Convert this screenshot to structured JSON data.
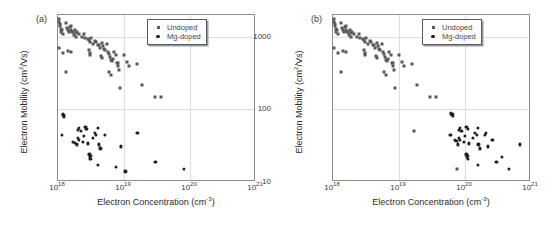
{
  "figure": {
    "panels": [
      {
        "letter": "(a)",
        "xlabel": "Electron Concentration (cm",
        "xlabel_sup": "-3",
        "xlabel_tail": ")",
        "ylabel_head": "Electron Mobility (cm",
        "ylabel_sup": "2",
        "ylabel_tail": "/Vs)",
        "legend": [
          {
            "label": "Undoped",
            "marker": "square"
          },
          {
            "label": "Mg-doped",
            "marker": "circle"
          }
        ]
      },
      {
        "letter": "(b)",
        "xlabel": "Electron Concentration (cm",
        "xlabel_sup": "-3",
        "xlabel_tail": ")",
        "ylabel_head": "Electron Mobility (cm",
        "ylabel_sup": "2",
        "ylabel_tail": "/Vs)",
        "legend": [
          {
            "label": "Undoped",
            "marker": "square"
          },
          {
            "label": "Mg-doped",
            "marker": "circle"
          }
        ]
      }
    ]
  },
  "chart_data": [
    {
      "type": "scatter",
      "panel": "(a)",
      "title": "",
      "xlabel": "Electron Concentration (cm^-3)",
      "ylabel": "Electron Mobility (cm^2/Vs)",
      "xscale": "log",
      "yscale": "log",
      "xlim": [
        1e+18,
        1e+21
      ],
      "ylim": [
        10,
        2000
      ],
      "xticks": [
        1e+18,
        1e+19,
        1e+20,
        1e+21
      ],
      "xticklabels": [
        "10^18",
        "10^19",
        "10^20",
        "10^21"
      ],
      "yticks": [
        10,
        100,
        1000
      ],
      "yticklabels": [
        "10",
        "100",
        "1000"
      ],
      "grid": true,
      "legend_position": "upper right",
      "series": [
        {
          "name": "Undoped",
          "marker": "square",
          "color": "#55595e",
          "points": [
            [
              1.02e+18,
              1750
            ],
            [
              1.05e+18,
              1620
            ],
            [
              1.06e+18,
              1500
            ],
            [
              1.08e+18,
              1400
            ],
            [
              1.1e+18,
              1300
            ],
            [
              1.12e+18,
              1180
            ],
            [
              1.15e+18,
              1250
            ],
            [
              1.18e+18,
              1100
            ],
            [
              1.05e+18,
              700
            ],
            [
              1.2e+18,
              590
            ],
            [
              1.3e+18,
              1550
            ],
            [
              1.35e+18,
              1320
            ],
            [
              1.4e+18,
              1240
            ],
            [
              1.45e+18,
              1150
            ],
            [
              1.5e+18,
              1380
            ],
            [
              1.55e+18,
              1260
            ],
            [
              1.6e+18,
              1420
            ],
            [
              1.65e+18,
              1180
            ],
            [
              1.7e+18,
              1150
            ],
            [
              1.75e+18,
              1050
            ],
            [
              1.8e+18,
              1230
            ],
            [
              1.85e+18,
              1130
            ],
            [
              1.9e+18,
              980
            ],
            [
              1.95e+18,
              1160
            ],
            [
              1.4e+18,
              640
            ],
            [
              1.55e+18,
              610
            ],
            [
              1.3e+18,
              330
            ],
            [
              2.1e+18,
              1080
            ],
            [
              2.3e+18,
              1010
            ],
            [
              2.5e+18,
              1090
            ],
            [
              2.6e+18,
              960
            ],
            [
              2.8e+18,
              930
            ],
            [
              3e+18,
              900
            ],
            [
              3.1e+18,
              860
            ],
            [
              3.2e+18,
              950
            ],
            [
              3.4e+18,
              800
            ],
            [
              3e+18,
              650
            ],
            [
              3.05e+18,
              600
            ],
            [
              3.1e+18,
              560
            ],
            [
              3.6e+18,
              880
            ],
            [
              3.8e+18,
              840
            ],
            [
              4e+18,
              780
            ],
            [
              4.2e+18,
              760
            ],
            [
              4.4e+18,
              700
            ],
            [
              4.6e+18,
              830
            ],
            [
              4.8e+18,
              740
            ],
            [
              5e+18,
              690
            ],
            [
              5.2e+18,
              660
            ],
            [
              4.5e+18,
              540
            ],
            [
              4.7e+18,
              505
            ],
            [
              5.5e+18,
              800
            ],
            [
              5.8e+18,
              620
            ],
            [
              6e+18,
              580
            ],
            [
              6.2e+18,
              520
            ],
            [
              6.4e+18,
              480
            ],
            [
              6.6e+18,
              460
            ],
            [
              6.8e+18,
              500
            ],
            [
              6e+18,
              330
            ],
            [
              6.3e+18,
              300
            ],
            [
              7e+18,
              620
            ],
            [
              7.5e+18,
              560
            ],
            [
              7.8e+18,
              430
            ],
            [
              8e+18,
              440
            ],
            [
              8.2e+18,
              400
            ],
            [
              8.5e+18,
              350
            ],
            [
              8.8e+18,
              195
            ],
            [
              1e+19,
              560
            ],
            [
              1.1e+19,
              450
            ],
            [
              1.2e+19,
              400
            ],
            [
              1.6e+19,
              420
            ],
            [
              1.9e+19,
              215
            ],
            [
              3e+19,
              148
            ],
            [
              3.6e+19,
              148
            ]
          ]
        },
        {
          "name": "Mg-doped",
          "marker": "circle",
          "color": "#1d1f22",
          "points": [
            [
              1.18e+18,
              86
            ],
            [
              1.2e+18,
              83
            ],
            [
              1.22e+18,
              80
            ],
            [
              1.24e+18,
              84
            ],
            [
              1.15e+18,
              45
            ],
            [
              1.7e+18,
              36
            ],
            [
              1.8e+18,
              35
            ],
            [
              2e+18,
              52
            ],
            [
              2.1e+18,
              55
            ],
            [
              2.2e+18,
              50
            ],
            [
              2e+18,
              40
            ],
            [
              2.1e+18,
              38
            ],
            [
              1.95e+18,
              33
            ],
            [
              2.4e+18,
              36
            ],
            [
              2.5e+18,
              43
            ],
            [
              2.6e+18,
              57
            ],
            [
              2.7e+18,
              54
            ],
            [
              2.8e+18,
              34
            ],
            [
              3e+18,
              24
            ],
            [
              3.05e+18,
              22
            ],
            [
              3.1e+18,
              21
            ],
            [
              3.15e+18,
              23
            ],
            [
              3.4e+18,
              40
            ],
            [
              3.6e+18,
              47
            ],
            [
              3.8e+18,
              44
            ],
            [
              4e+18,
              56
            ],
            [
              4.2e+18,
              33
            ],
            [
              4.4e+18,
              29
            ],
            [
              4e+18,
              17
            ],
            [
              5.2e+18,
              44
            ],
            [
              7.5e+18,
              16
            ],
            [
              9e+18,
              31
            ],
            [
              1.05e+19,
              14
            ],
            [
              1.6e+19,
              48
            ],
            [
              3e+19,
              19
            ],
            [
              8e+19,
              15
            ]
          ]
        }
      ]
    },
    {
      "type": "scatter",
      "panel": "(b)",
      "title": "",
      "xlabel": "Electron Concentration (cm^-3)",
      "ylabel": "Electron Mobility (cm^2/Vs)",
      "xscale": "log",
      "yscale": "log",
      "xlim": [
        1e+18,
        1e+21
      ],
      "ylim": [
        10,
        2000
      ],
      "xticks": [
        1e+18,
        1e+19,
        1e+20,
        1e+21
      ],
      "xticklabels": [
        "10^18",
        "10^19",
        "10^20",
        "10^21"
      ],
      "yticks": [
        10,
        100,
        1000
      ],
      "yticklabels": [
        "10",
        "100",
        "1000"
      ],
      "grid": true,
      "legend_position": "upper right",
      "series": [
        {
          "name": "Undoped",
          "marker": "square",
          "color": "#55595e",
          "points": [
            [
              1.02e+18,
              1750
            ],
            [
              1.05e+18,
              1620
            ],
            [
              1.06e+18,
              1500
            ],
            [
              1.08e+18,
              1400
            ],
            [
              1.1e+18,
              1300
            ],
            [
              1.12e+18,
              1180
            ],
            [
              1.15e+18,
              1250
            ],
            [
              1.18e+18,
              1100
            ],
            [
              1.05e+18,
              700
            ],
            [
              1.2e+18,
              590
            ],
            [
              1.3e+18,
              1550
            ],
            [
              1.35e+18,
              1320
            ],
            [
              1.4e+18,
              1240
            ],
            [
              1.45e+18,
              1150
            ],
            [
              1.5e+18,
              1380
            ],
            [
              1.55e+18,
              1260
            ],
            [
              1.6e+18,
              1420
            ],
            [
              1.65e+18,
              1180
            ],
            [
              1.7e+18,
              1150
            ],
            [
              1.75e+18,
              1050
            ],
            [
              1.8e+18,
              1230
            ],
            [
              1.85e+18,
              1130
            ],
            [
              1.9e+18,
              980
            ],
            [
              1.95e+18,
              1160
            ],
            [
              1.4e+18,
              640
            ],
            [
              1.55e+18,
              610
            ],
            [
              1.3e+18,
              330
            ],
            [
              2.1e+18,
              1080
            ],
            [
              2.3e+18,
              1010
            ],
            [
              2.5e+18,
              1090
            ],
            [
              2.6e+18,
              960
            ],
            [
              2.8e+18,
              930
            ],
            [
              3e+18,
              900
            ],
            [
              3.1e+18,
              860
            ],
            [
              3.2e+18,
              950
            ],
            [
              3.4e+18,
              800
            ],
            [
              3e+18,
              650
            ],
            [
              3.05e+18,
              600
            ],
            [
              3.1e+18,
              560
            ],
            [
              3.6e+18,
              880
            ],
            [
              3.8e+18,
              840
            ],
            [
              4e+18,
              780
            ],
            [
              4.2e+18,
              760
            ],
            [
              4.4e+18,
              700
            ],
            [
              4.6e+18,
              830
            ],
            [
              4.8e+18,
              740
            ],
            [
              5e+18,
              690
            ],
            [
              5.2e+18,
              660
            ],
            [
              4.5e+18,
              540
            ],
            [
              4.7e+18,
              505
            ],
            [
              5.5e+18,
              800
            ],
            [
              5.8e+18,
              620
            ],
            [
              6e+18,
              580
            ],
            [
              6.2e+18,
              520
            ],
            [
              6.4e+18,
              480
            ],
            [
              6.6e+18,
              460
            ],
            [
              6.8e+18,
              500
            ],
            [
              6e+18,
              330
            ],
            [
              6.3e+18,
              300
            ],
            [
              7e+18,
              620
            ],
            [
              7.5e+18,
              560
            ],
            [
              7.8e+18,
              430
            ],
            [
              8e+18,
              440
            ],
            [
              8.2e+18,
              400
            ],
            [
              8.5e+18,
              350
            ],
            [
              8.8e+18,
              195
            ],
            [
              1e+19,
              560
            ],
            [
              1.1e+19,
              450
            ],
            [
              1.2e+19,
              400
            ],
            [
              1.6e+19,
              420
            ],
            [
              1.9e+19,
              215
            ],
            [
              3e+19,
              148
            ],
            [
              3.6e+19,
              148
            ],
            [
              1.7e+19,
              50
            ],
            [
              7.5e+19,
              15
            ]
          ]
        },
        {
          "name": "Mg-doped",
          "marker": "circle",
          "color": "#1d1f22",
          "points": [
            [
              6.2e+19,
              88
            ],
            [
              6.4e+19,
              85
            ],
            [
              6.5e+19,
              82
            ],
            [
              6.6e+19,
              86
            ],
            [
              6e+19,
              44
            ],
            [
              7e+19,
              38
            ],
            [
              7.4e+19,
              37
            ],
            [
              8e+19,
              52
            ],
            [
              8.4e+19,
              55
            ],
            [
              8.8e+19,
              50
            ],
            [
              8e+19,
              40
            ],
            [
              8.4e+19,
              38
            ],
            [
              7.8e+19,
              33
            ],
            [
              9.5e+19,
              36
            ],
            [
              1e+20,
              43
            ],
            [
              1.05e+20,
              57
            ],
            [
              1.1e+20,
              54
            ],
            [
              1.15e+20,
              34
            ],
            [
              1.05e+20,
              24
            ],
            [
              1.08e+20,
              22
            ],
            [
              1.1e+20,
              21
            ],
            [
              1.12e+20,
              23
            ],
            [
              1.3e+20,
              40
            ],
            [
              1.4e+20,
              47
            ],
            [
              1.5e+20,
              44
            ],
            [
              1.55e+20,
              56
            ],
            [
              1.6e+20,
              33
            ],
            [
              1.7e+20,
              29
            ],
            [
              1.55e+20,
              17
            ],
            [
              2e+20,
              44
            ],
            [
              2.1e+20,
              48
            ],
            [
              2.2e+20,
              31
            ],
            [
              2.6e+20,
              38
            ],
            [
              3e+20,
              19
            ],
            [
              3.6e+20,
              22
            ],
            [
              4.6e+20,
              15
            ],
            [
              6.8e+20,
              33
            ]
          ]
        }
      ]
    }
  ]
}
